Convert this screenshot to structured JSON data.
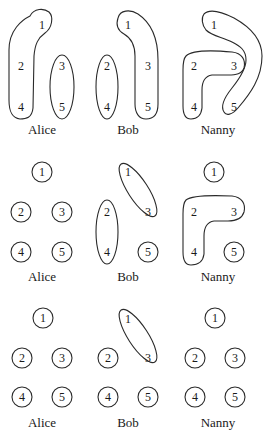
{
  "panels": [
    {
      "row": 1,
      "agents": [
        {
          "name": "Alice",
          "partition": [
            [
              "1",
              "2",
              "4"
            ],
            [
              "3",
              "5"
            ]
          ]
        },
        {
          "name": "Bob",
          "partition": [
            [
              "2",
              "4"
            ],
            [
              "1",
              "3",
              "5"
            ]
          ]
        },
        {
          "name": "Nanny",
          "partition": [
            [
              "2",
              "3",
              "4"
            ],
            [
              "1",
              "5"
            ]
          ]
        }
      ]
    },
    {
      "row": 2,
      "agents": [
        {
          "name": "Alice",
          "partition": [
            [
              "1"
            ],
            [
              "2"
            ],
            [
              "3"
            ],
            [
              "4"
            ],
            [
              "5"
            ]
          ]
        },
        {
          "name": "Bob",
          "partition": [
            [
              "1",
              "3"
            ],
            [
              "2",
              "4"
            ],
            [
              "5"
            ]
          ]
        },
        {
          "name": "Nanny",
          "partition": [
            [
              "1"
            ],
            [
              "2",
              "3",
              "4"
            ],
            [
              "5"
            ]
          ]
        }
      ]
    },
    {
      "row": 3,
      "agents": [
        {
          "name": "Alice",
          "partition": [
            [
              "1"
            ],
            [
              "2"
            ],
            [
              "3"
            ],
            [
              "4"
            ],
            [
              "5"
            ]
          ]
        },
        {
          "name": "Bob",
          "partition": [
            [
              "1",
              "3"
            ],
            [
              "2"
            ],
            [
              "4"
            ],
            [
              "5"
            ]
          ]
        },
        {
          "name": "Nanny",
          "partition": [
            [
              "1"
            ],
            [
              "2"
            ],
            [
              "3"
            ],
            [
              "4"
            ],
            [
              "5"
            ]
          ]
        }
      ]
    }
  ],
  "labels": {
    "alice": "Alice",
    "bob": "Bob",
    "nanny": "Nanny"
  },
  "states": {
    "s1": "1",
    "s2": "2",
    "s3": "3",
    "s4": "4",
    "s5": "5"
  },
  "colors": {
    "stroke": "#2a2a2a",
    "text": "#1a1a1a",
    "background": "#ffffff"
  }
}
